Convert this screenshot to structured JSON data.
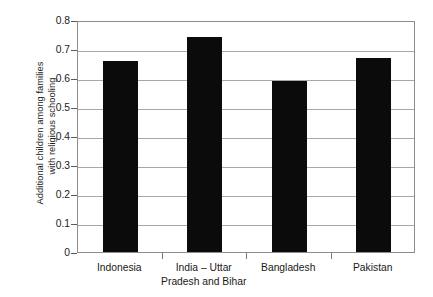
{
  "chart_data": {
    "type": "bar",
    "title": "",
    "subtitle": "",
    "xlabel": "",
    "ylabel": "Additional children among families with religious schooling",
    "ylabel_lines": [
      "Additional children among families",
      "with religious schooling"
    ],
    "categories": [
      "Indonesia",
      "India – Uttar Pradesh and Bihar",
      "Bangladesh",
      "Pakistan"
    ],
    "category_lines": [
      [
        "Indonesia"
      ],
      [
        "India – Uttar",
        "Pradesh and Bihar"
      ],
      [
        "Bangladesh"
      ],
      [
        "Pakistan"
      ]
    ],
    "values": [
      0.66,
      0.74,
      0.59,
      0.67
    ],
    "ylim": [
      0,
      0.8
    ],
    "ytick_labels": [
      "0",
      "0.1",
      "0.2",
      "0.3",
      "0.4",
      "0.5",
      "0.6",
      "0.7",
      "0.8"
    ],
    "ytick_values": [
      0,
      0.1,
      0.2,
      0.3,
      0.4,
      0.5,
      0.6,
      0.7,
      0.8
    ],
    "grid": "horizontal",
    "legend": "none",
    "bar_color": "#0b0b0b",
    "grid_color": "#a8a8a8",
    "frame_color": "#8d8d8d",
    "background_color": "#ffffff"
  }
}
